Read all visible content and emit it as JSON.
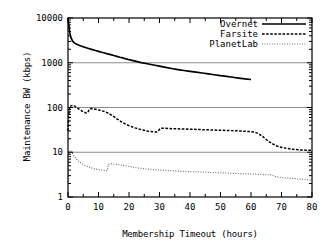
{
  "chart_data": {
    "type": "line",
    "title": "",
    "xlabel": "Membership Timeout (hours)",
    "ylabel": "Maintenance BW (kbps)",
    "xlim": [
      0,
      80
    ],
    "ylim": [
      1,
      10000
    ],
    "yscale": "log",
    "xscale": "linear",
    "grid": "horizontal-major",
    "xticks": [
      0,
      10,
      20,
      30,
      40,
      50,
      60,
      70,
      80
    ],
    "xticklabels": [
      "0",
      "10",
      "20",
      "30",
      "40",
      "50",
      "60",
      "70",
      "80"
    ],
    "yticks": [
      1,
      10,
      100,
      1000,
      10000
    ],
    "yticklabels": [
      "1",
      "10",
      "100",
      "1000",
      "10000"
    ],
    "legend_position": "top-right",
    "series": [
      {
        "name": "Overnet",
        "style": "solid",
        "color": "#000000",
        "points": [
          [
            0.0,
            10000
          ],
          [
            0.3,
            6500
          ],
          [
            0.6,
            4600
          ],
          [
            1.0,
            3600
          ],
          [
            1.5,
            3050
          ],
          [
            2.0,
            2820
          ],
          [
            3.0,
            2560
          ],
          [
            4.0,
            2400
          ],
          [
            5.0,
            2270
          ],
          [
            6.0,
            2160
          ],
          [
            7.0,
            2060
          ],
          [
            8.0,
            1970
          ],
          [
            9.0,
            1880
          ],
          [
            10.0,
            1800
          ],
          [
            11.0,
            1720
          ],
          [
            12.0,
            1650
          ],
          [
            13.0,
            1580
          ],
          [
            14.0,
            1520
          ],
          [
            15.0,
            1450
          ],
          [
            16.0,
            1390
          ],
          [
            17.0,
            1330
          ],
          [
            18.0,
            1280
          ],
          [
            19.0,
            1220
          ],
          [
            20.0,
            1170
          ],
          [
            22.0,
            1090
          ],
          [
            24.0,
            1010
          ],
          [
            26.0,
            950
          ],
          [
            28.0,
            890
          ],
          [
            30.0,
            840
          ],
          [
            32.0,
            790
          ],
          [
            34.0,
            745
          ],
          [
            36.0,
            705
          ],
          [
            38.0,
            670
          ],
          [
            40.0,
            640
          ],
          [
            42.0,
            615
          ],
          [
            44.0,
            590
          ],
          [
            46.0,
            565
          ],
          [
            48.0,
            540
          ],
          [
            50.0,
            515
          ],
          [
            52.0,
            495
          ],
          [
            54.0,
            475
          ],
          [
            56.0,
            455
          ],
          [
            58.0,
            438
          ],
          [
            60.0,
            422
          ]
        ]
      },
      {
        "name": "Farsite",
        "style": "dashed",
        "color": "#000000",
        "points": [
          [
            0.0,
            30
          ],
          [
            0.2,
            62
          ],
          [
            0.5,
            95
          ],
          [
            1.0,
            110
          ],
          [
            1.6,
            112
          ],
          [
            2.2,
            107
          ],
          [
            3.0,
            98
          ],
          [
            4.0,
            88
          ],
          [
            5.0,
            80
          ],
          [
            6.0,
            75
          ],
          [
            6.5,
            78
          ],
          [
            7.0,
            92
          ],
          [
            7.5,
            95
          ],
          [
            8.5,
            93
          ],
          [
            10.0,
            88
          ],
          [
            11.5,
            83
          ],
          [
            13.0,
            76
          ],
          [
            14.5,
            66
          ],
          [
            16.0,
            56
          ],
          [
            17.5,
            48
          ],
          [
            19.0,
            42
          ],
          [
            20.5,
            38
          ],
          [
            22.0,
            35
          ],
          [
            24.0,
            32
          ],
          [
            26.0,
            30
          ],
          [
            28.0,
            28.5
          ],
          [
            29.0,
            28.2
          ],
          [
            29.6,
            30
          ],
          [
            30.2,
            34
          ],
          [
            31.0,
            34.5
          ],
          [
            33.0,
            34
          ],
          [
            35.0,
            33.5
          ],
          [
            38.0,
            33
          ],
          [
            41.0,
            32.5
          ],
          [
            44.0,
            32
          ],
          [
            47.0,
            31.5
          ],
          [
            50.0,
            31
          ],
          [
            53.0,
            30.5
          ],
          [
            56.0,
            30
          ],
          [
            59.0,
            29.2
          ],
          [
            61.0,
            28.5
          ],
          [
            62.5,
            26
          ],
          [
            64.0,
            22
          ],
          [
            65.5,
            18
          ],
          [
            67.0,
            15.5
          ],
          [
            68.5,
            13.8
          ],
          [
            70.0,
            12.8
          ],
          [
            72.0,
            12.1
          ],
          [
            74.0,
            11.6
          ],
          [
            76.0,
            11.3
          ],
          [
            78.0,
            11.1
          ],
          [
            80.0,
            11.0
          ]
        ]
      },
      {
        "name": "PlanetLab",
        "style": "dotted",
        "color": "#666666",
        "points": [
          [
            0.0,
            2.2
          ],
          [
            0.2,
            6.0
          ],
          [
            0.5,
            10.5
          ],
          [
            0.9,
            11.0
          ],
          [
            1.4,
            9.6
          ],
          [
            2.0,
            8.2
          ],
          [
            2.8,
            7.0
          ],
          [
            3.6,
            6.2
          ],
          [
            4.5,
            5.6
          ],
          [
            5.5,
            5.1
          ],
          [
            6.5,
            4.8
          ],
          [
            7.5,
            4.5
          ],
          [
            8.5,
            4.3
          ],
          [
            9.5,
            4.15
          ],
          [
            10.5,
            4.05
          ],
          [
            11.5,
            3.95
          ],
          [
            12.5,
            3.9
          ],
          [
            12.9,
            3.88
          ],
          [
            13.2,
            5.3
          ],
          [
            13.8,
            5.5
          ],
          [
            14.5,
            5.5
          ],
          [
            15.5,
            5.4
          ],
          [
            16.5,
            5.3
          ],
          [
            18.0,
            5.1
          ],
          [
            19.5,
            4.9
          ],
          [
            21.0,
            4.7
          ],
          [
            22.5,
            4.5
          ],
          [
            24.0,
            4.35
          ],
          [
            26.0,
            4.2
          ],
          [
            28.0,
            4.1
          ],
          [
            30.0,
            4.0
          ],
          [
            33.0,
            3.9
          ],
          [
            36.0,
            3.8
          ],
          [
            39.0,
            3.72
          ],
          [
            42.0,
            3.65
          ],
          [
            45.0,
            3.58
          ],
          [
            48.0,
            3.5
          ],
          [
            51.0,
            3.44
          ],
          [
            54.0,
            3.38
          ],
          [
            57.0,
            3.32
          ],
          [
            60.0,
            3.26
          ],
          [
            63.0,
            3.2
          ],
          [
            65.5,
            3.15
          ],
          [
            67.0,
            3.1
          ],
          [
            68.0,
            2.85
          ],
          [
            69.5,
            2.75
          ],
          [
            71.0,
            2.7
          ],
          [
            73.0,
            2.62
          ],
          [
            75.0,
            2.55
          ],
          [
            77.0,
            2.48
          ],
          [
            78.5,
            2.44
          ],
          [
            80.0,
            2.4
          ]
        ]
      }
    ]
  },
  "legend": {
    "entries": [
      {
        "label": "Overnet"
      },
      {
        "label": "Farsite"
      },
      {
        "label": "PlanetLab"
      }
    ]
  }
}
